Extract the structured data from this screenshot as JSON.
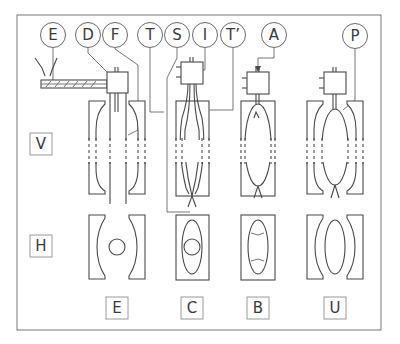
{
  "diagram": {
    "title": "",
    "callouts": [
      {
        "id": "E",
        "label": "E",
        "cx": 53,
        "cy": 35
      },
      {
        "id": "D",
        "label": "D",
        "cx": 88,
        "cy": 35
      },
      {
        "id": "F",
        "label": "F",
        "cx": 115,
        "cy": 35
      },
      {
        "id": "T",
        "label": "T",
        "cx": 150,
        "cy": 35
      },
      {
        "id": "S",
        "label": "S",
        "cx": 177,
        "cy": 35
      },
      {
        "id": "I",
        "label": "I",
        "cx": 205,
        "cy": 35
      },
      {
        "id": "T_prime",
        "label": "T’",
        "cx": 233,
        "cy": 35
      },
      {
        "id": "A",
        "label": "A",
        "cx": 274,
        "cy": 35
      },
      {
        "id": "P",
        "label": "P",
        "cx": 355,
        "cy": 36
      }
    ],
    "row_labels": [
      {
        "id": "V",
        "label": "V"
      },
      {
        "id": "H",
        "label": "H"
      }
    ],
    "stage_labels": [
      {
        "id": "E",
        "label": "E"
      },
      {
        "id": "C",
        "label": "C"
      },
      {
        "id": "B",
        "label": "B"
      },
      {
        "id": "U",
        "label": "U"
      }
    ],
    "colors": {
      "line": "#4a4a4a",
      "box_border": "#9a9a9a",
      "background": "#ffffff"
    }
  }
}
